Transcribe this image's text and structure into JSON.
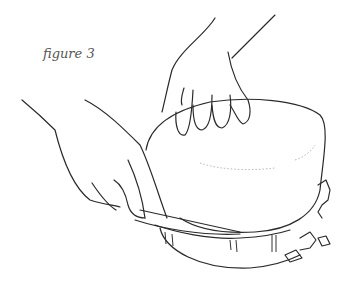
{
  "figure": {
    "caption": "figure 3",
    "colors": {
      "line": "#2a2a2a",
      "caption": "#555555",
      "background": "#ffffff"
    }
  }
}
